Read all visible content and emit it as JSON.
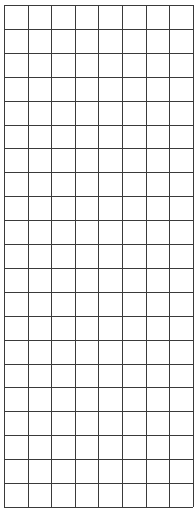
{
  "grid": {
    "columns": 8,
    "rows": 21,
    "origin_x": 4,
    "origin_y": 5,
    "cell_width": 23.6,
    "cell_height": 23.9,
    "line_color": "#3a3a3a",
    "background": "#ffffff"
  }
}
